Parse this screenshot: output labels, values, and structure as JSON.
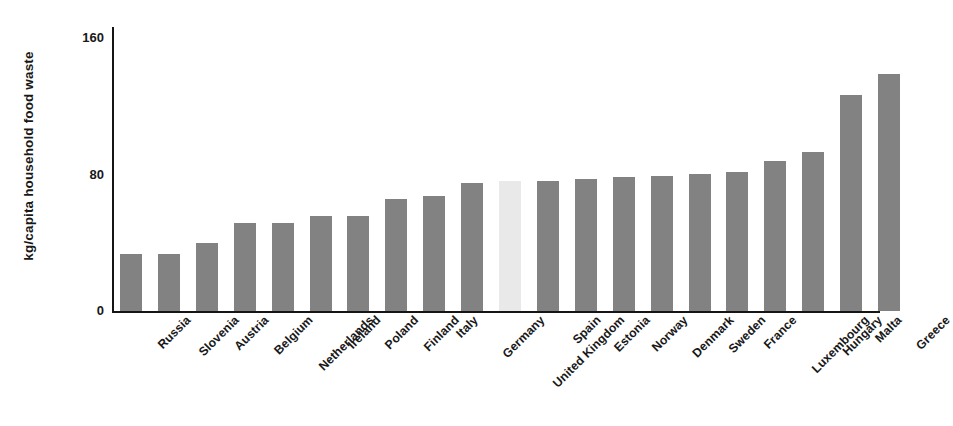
{
  "chart_data": {
    "type": "bar",
    "title": "",
    "subtitle": "",
    "xlabel": "",
    "ylabel": "kg/capita household food waste",
    "ylim": [
      0,
      168
    ],
    "yticks": [
      0,
      80,
      160
    ],
    "ytick_labels": [
      "0",
      "80",
      "160"
    ],
    "grid": false,
    "legend": null,
    "categories": [
      "Russia",
      "Slovenia",
      "Austria",
      "Belgium",
      "Netherlands",
      "Ireland",
      "Poland",
      "Finland",
      "Italy",
      "Germany",
      "United Kingdom",
      "Spain",
      "Estonia",
      "Norway",
      "Denmark",
      "Sweden",
      "France",
      "Luxembourg",
      "Hungary",
      "Malta",
      "Greece"
    ],
    "values": [
      34,
      34,
      40,
      52,
      52,
      56,
      56,
      66,
      68,
      76,
      77,
      77,
      78,
      79,
      80,
      81,
      82,
      89,
      94,
      128,
      140
    ],
    "highlighted_category": "United Kingdom",
    "colors": {
      "bar": "#828282",
      "bar_highlight": "#e9e9e9",
      "axis": "#151515",
      "text": "#181818",
      "background": "#ffffff"
    }
  }
}
